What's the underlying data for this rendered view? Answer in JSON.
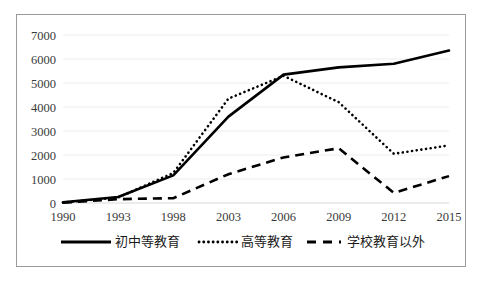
{
  "chart_data": {
    "type": "line",
    "title": "",
    "xlabel": "",
    "ylabel": "",
    "x": [
      1990,
      1993,
      1998,
      2003,
      2006,
      2009,
      2012,
      2015
    ],
    "categories": [
      "1990",
      "1993",
      "1998",
      "2003",
      "2006",
      "2009",
      "2012",
      "2015"
    ],
    "xtick_labels": [
      "1990",
      "1993",
      "1998",
      "2003",
      "2006",
      "2009",
      "2012",
      "2015"
    ],
    "ytick_labels": [
      "0",
      "1000",
      "2000",
      "3000",
      "4000",
      "5000",
      "6000",
      "7000"
    ],
    "ylim": [
      0,
      7000
    ],
    "ytick_step": 1000,
    "grid": true,
    "legend_position": "bottom",
    "series": [
      {
        "name": "初中等教育",
        "style": "solid",
        "color": "#000000",
        "values": [
          30,
          250,
          1150,
          3600,
          5350,
          5650,
          5800,
          6350
        ]
      },
      {
        "name": "高等教育",
        "style": "dotted",
        "color": "#000000",
        "values": [
          20,
          230,
          1250,
          4350,
          5300,
          4200,
          2050,
          2400
        ]
      },
      {
        "name": "学校教育以外",
        "style": "dashed",
        "color": "#000000",
        "values": [
          10,
          160,
          200,
          1200,
          1900,
          2280,
          420,
          1120
        ]
      }
    ]
  },
  "legend": {
    "items": [
      {
        "label": "初中等教育",
        "style": "solid"
      },
      {
        "label": "高等教育",
        "style": "dotted"
      },
      {
        "label": "学校教育以外",
        "style": "dashed"
      }
    ]
  }
}
